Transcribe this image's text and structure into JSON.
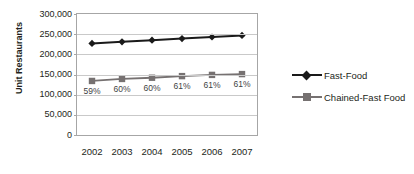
{
  "chart_data": {
    "type": "line",
    "title": "",
    "xlabel": "",
    "ylabel": "Unit Restaurants",
    "categories": [
      "2002",
      "2003",
      "2004",
      "2005",
      "2006",
      "2007"
    ],
    "ylim": [
      0,
      300000
    ],
    "ytick_labels": [
      "300,000",
      "250,000",
      "200,000",
      "150,000",
      "100,000",
      "50,000",
      "0"
    ],
    "ytick_values": [
      300000,
      250000,
      200000,
      150000,
      100000,
      50000,
      0
    ],
    "grid": true,
    "legend_position": "right",
    "series": [
      {
        "name": "Fast-Food",
        "color": "#1a1a1a",
        "marker": "diamond",
        "values": [
          227000,
          231000,
          235000,
          239000,
          243000,
          247000
        ]
      },
      {
        "name": "Chained-Fast Food",
        "color": "#767171",
        "marker": "square",
        "values": [
          134000,
          139000,
          142000,
          146000,
          149000,
          151000
        ]
      }
    ],
    "annotations": [
      {
        "category": "2002",
        "text": "59%"
      },
      {
        "category": "2003",
        "text": "60%"
      },
      {
        "category": "2004",
        "text": "60%"
      },
      {
        "category": "2005",
        "text": "61%"
      },
      {
        "category": "2006",
        "text": "61%"
      },
      {
        "category": "2007",
        "text": "61%"
      }
    ]
  },
  "colors": {
    "plot_border": "#a6a6a6",
    "gridline": "#c9c9c9",
    "text": "#231f20",
    "background": "#ffffff"
  }
}
